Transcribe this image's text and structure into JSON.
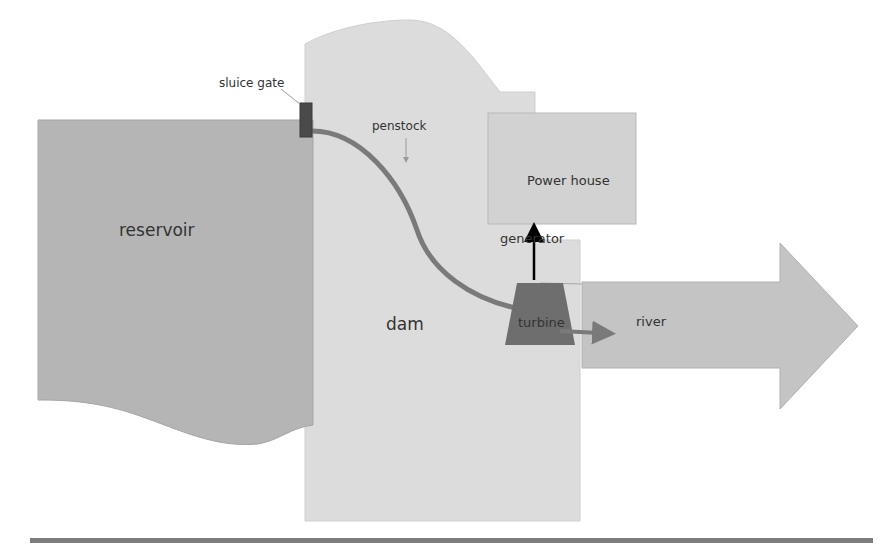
{
  "diagram": {
    "labels": {
      "sluice_gate": "sluice gate",
      "penstock": "penstock",
      "power_house": "Power house",
      "generator": "generator",
      "reservoir": "reservoir",
      "dam": "dam",
      "turbine": "turbine",
      "river": "river"
    },
    "colors": {
      "reservoir": "#b5b5b5",
      "dam": "#dcdcdc",
      "power_house": "#d2d2d2",
      "river": "#c4c4c4",
      "penstock": "#7a7a7a",
      "turbine": "#6e6e6e",
      "sluice_gate": "#4a4a4a",
      "generator_arrow": "#000000",
      "ground_line": "#7d7d7d",
      "text": "#333333"
    }
  }
}
